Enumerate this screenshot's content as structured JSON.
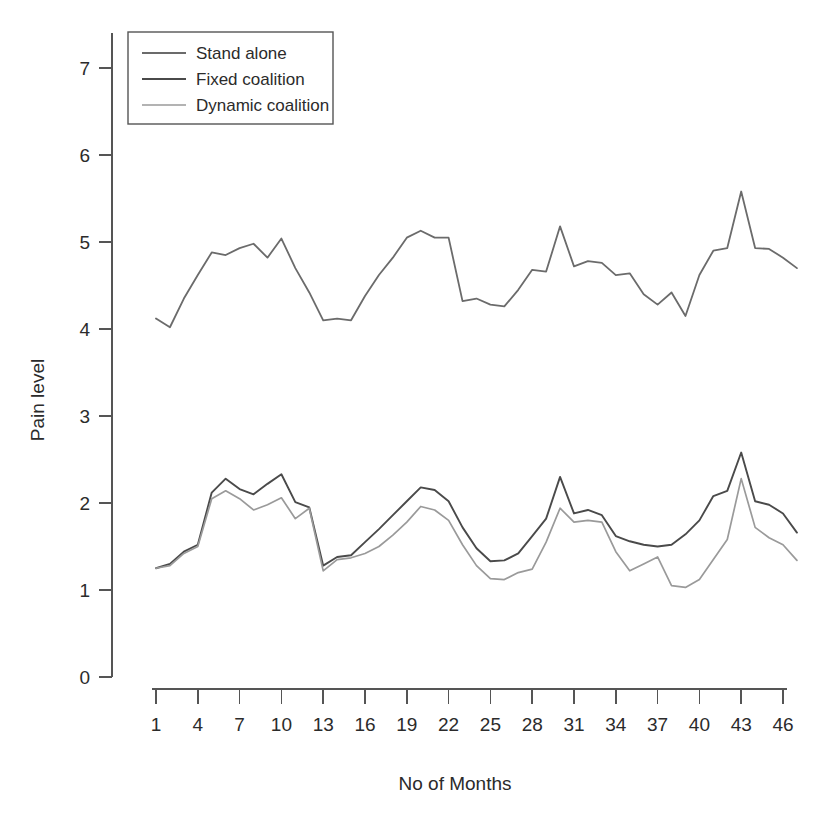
{
  "chart_data": {
    "type": "line",
    "title": "",
    "xlabel": "No of Months",
    "ylabel": "Pain level",
    "xlim": [
      1,
      48
    ],
    "ylim": [
      0,
      7.4
    ],
    "grid": false,
    "legend_position": "top-left",
    "x_ticks": [
      1,
      4,
      7,
      10,
      13,
      16,
      19,
      22,
      25,
      28,
      31,
      34,
      37,
      40,
      43,
      46
    ],
    "y_ticks": [
      0,
      1,
      2,
      3,
      4,
      5,
      6,
      7
    ],
    "x": [
      1,
      2,
      3,
      4,
      5,
      6,
      7,
      8,
      9,
      10,
      11,
      12,
      13,
      14,
      15,
      16,
      17,
      18,
      19,
      20,
      21,
      22,
      23,
      24,
      25,
      26,
      27,
      28,
      29,
      30,
      31,
      32,
      33,
      34,
      35,
      36,
      37,
      38,
      39,
      40,
      41,
      42,
      43,
      44,
      45,
      46,
      47
    ],
    "series": [
      {
        "name": "Stand alone",
        "color": "#6b6b6b",
        "width": 1.8,
        "values": [
          4.12,
          4.02,
          4.35,
          4.62,
          4.88,
          4.85,
          4.93,
          4.98,
          4.82,
          5.04,
          4.7,
          4.42,
          4.1,
          4.12,
          4.1,
          4.38,
          4.62,
          4.82,
          5.05,
          5.13,
          5.05,
          5.05,
          4.32,
          4.35,
          4.28,
          4.26,
          4.45,
          4.68,
          4.66,
          5.18,
          4.72,
          4.78,
          4.76,
          4.62,
          4.64,
          4.4,
          4.28,
          4.42,
          4.15,
          4.62,
          4.9,
          4.93,
          5.58,
          4.93,
          4.92,
          4.82,
          4.7
        ]
      },
      {
        "name": "Fixed coalition",
        "color": "#4a4a4a",
        "width": 1.9,
        "values": [
          1.25,
          1.3,
          1.44,
          1.52,
          2.12,
          2.28,
          2.16,
          2.1,
          2.22,
          2.33,
          2.01,
          1.95,
          1.28,
          1.38,
          1.4,
          1.55,
          1.7,
          1.86,
          2.02,
          2.18,
          2.15,
          2.02,
          1.72,
          1.48,
          1.33,
          1.34,
          1.42,
          1.62,
          1.82,
          2.3,
          1.88,
          1.92,
          1.86,
          1.62,
          1.56,
          1.52,
          1.5,
          1.52,
          1.64,
          1.8,
          2.08,
          2.14,
          2.58,
          2.02,
          1.98,
          1.88,
          1.66
        ]
      },
      {
        "name": "Dynamic coalition",
        "color": "#9a9a9a",
        "width": 1.7,
        "values": [
          1.25,
          1.28,
          1.42,
          1.5,
          2.05,
          2.14,
          2.05,
          1.92,
          1.98,
          2.06,
          1.82,
          1.94,
          1.22,
          1.35,
          1.37,
          1.42,
          1.5,
          1.63,
          1.78,
          1.96,
          1.92,
          1.8,
          1.52,
          1.28,
          1.13,
          1.12,
          1.2,
          1.24,
          1.55,
          1.94,
          1.78,
          1.8,
          1.78,
          1.44,
          1.22,
          1.3,
          1.38,
          1.05,
          1.03,
          1.12,
          1.35,
          1.58,
          2.28,
          1.72,
          1.6,
          1.52,
          1.34
        ]
      }
    ]
  },
  "legend": {
    "items": [
      {
        "label": "Stand alone"
      },
      {
        "label": "Fixed coalition"
      },
      {
        "label": "Dynamic coalition"
      }
    ]
  },
  "axes": {
    "y_title": "Pain level",
    "x_title": "No of Months"
  }
}
